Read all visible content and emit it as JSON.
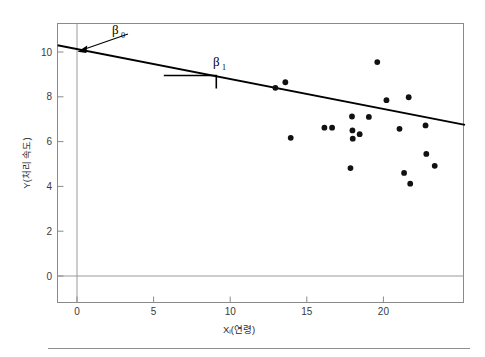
{
  "chart_data": {
    "type": "scatter",
    "title": "",
    "xlabel": "Xᵢ(연령)",
    "ylabel": "Y(처리 속도)",
    "xlim": [
      -1.2,
      25.3
    ],
    "ylim": [
      -1.8,
      11.4
    ],
    "xticks": [
      0,
      5,
      10,
      15,
      20
    ],
    "yticks": [
      0,
      2,
      4,
      6,
      8,
      10
    ],
    "xtick_labels": [
      "0",
      "5",
      "10",
      "15",
      "20"
    ],
    "ytick_labels": [
      "0",
      "2",
      "4",
      "6",
      "8",
      "10"
    ],
    "grid": false,
    "legend": "none",
    "points": [
      {
        "x": 12.95,
        "y": 8.4
      },
      {
        "x": 13.6,
        "y": 8.65
      },
      {
        "x": 13.95,
        "y": 6.17
      },
      {
        "x": 16.15,
        "y": 6.62
      },
      {
        "x": 16.65,
        "y": 6.62
      },
      {
        "x": 17.85,
        "y": 4.82
      },
      {
        "x": 17.95,
        "y": 7.12
      },
      {
        "x": 17.98,
        "y": 6.5
      },
      {
        "x": 18.0,
        "y": 6.13
      },
      {
        "x": 18.45,
        "y": 6.33
      },
      {
        "x": 19.05,
        "y": 7.1
      },
      {
        "x": 19.6,
        "y": 9.55
      },
      {
        "x": 20.2,
        "y": 7.85
      },
      {
        "x": 21.05,
        "y": 6.57
      },
      {
        "x": 21.35,
        "y": 4.6
      },
      {
        "x": 21.65,
        "y": 7.98
      },
      {
        "x": 21.75,
        "y": 4.12
      },
      {
        "x": 22.75,
        "y": 6.72
      },
      {
        "x": 22.8,
        "y": 5.45
      },
      {
        "x": 23.35,
        "y": 4.92
      }
    ],
    "regression_line": {
      "intercept": 10.22,
      "slope": -0.195,
      "x_start": -1.2,
      "x_end": 25.3,
      "description": "fitted least-squares regression line with negative slope"
    },
    "annotations": [
      {
        "name": "beta0",
        "label": "β",
        "subscript": "0",
        "description": "arrow pointing to y-intercept of regression line at x = 0",
        "target_x": 0,
        "target_y": 10.22
      },
      {
        "name": "beta1",
        "label": "β",
        "subscript": "1",
        "description": "slope triangle showing rise over run between x = 5.6 and x = 9.1",
        "run_x_start": 5.6,
        "run_x_end": 9.1,
        "run_y": 9.0,
        "drop_y": 8.42
      }
    ]
  },
  "figure": {
    "zero_line_x_value": "0",
    "zero_line_y_value": "0"
  }
}
